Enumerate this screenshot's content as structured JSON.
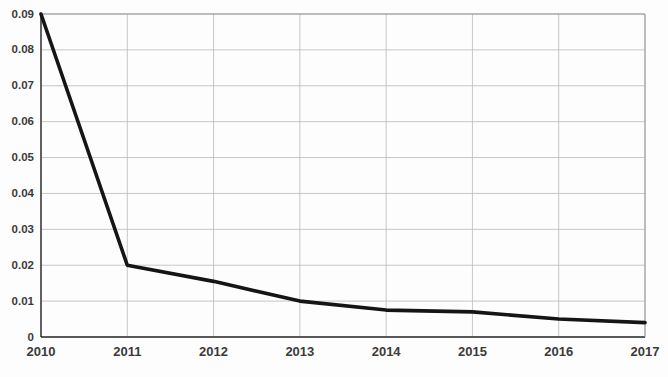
{
  "chart_data": {
    "type": "line",
    "title": "",
    "subtitle": "",
    "xlabel": "",
    "ylabel": "",
    "categories": [
      "2010",
      "2011",
      "2012",
      "2013",
      "2014",
      "2015",
      "2016",
      "2017"
    ],
    "x": [
      2010,
      2011,
      2012,
      2013,
      2014,
      2015,
      2016,
      2017
    ],
    "values": [
      0.09,
      0.02,
      0.0155,
      0.01,
      0.0075,
      0.007,
      0.005,
      0.004
    ],
    "series": [
      {
        "name": "series-1",
        "values": [
          0.09,
          0.02,
          0.0155,
          0.01,
          0.0075,
          0.007,
          0.005,
          0.004
        ]
      }
    ],
    "ylim": [
      0,
      0.09
    ],
    "xlim": [
      2010,
      2017
    ],
    "ytick_labels": [
      "0",
      "0.01",
      "0.02",
      "0.03",
      "0.04",
      "0.05",
      "0.06",
      "0.07",
      "0.08",
      "0.09"
    ],
    "ytick_values": [
      0,
      0.01,
      0.02,
      0.03,
      0.04,
      0.05,
      0.06,
      0.07,
      0.08,
      0.09
    ],
    "xtick_labels": [
      "2010",
      "2011",
      "2012",
      "2013",
      "2014",
      "2015",
      "2016",
      "2017"
    ],
    "grid": "both",
    "legend": "none",
    "line_color": "#151515",
    "grid_color": "#b9b9b9",
    "axis_color": "#2b2b2b",
    "background_color": "#fdfdfd",
    "annotations": []
  },
  "axes": {
    "y": {
      "ticks": [
        {
          "label": "0.09",
          "value": 0.09
        },
        {
          "label": "0.08",
          "value": 0.08
        },
        {
          "label": "0.07",
          "value": 0.07
        },
        {
          "label": "0.06",
          "value": 0.06
        },
        {
          "label": "0.05",
          "value": 0.05
        },
        {
          "label": "0.04",
          "value": 0.04
        },
        {
          "label": "0.03",
          "value": 0.03
        },
        {
          "label": "0.02",
          "value": 0.02
        },
        {
          "label": "0.01",
          "value": 0.01
        },
        {
          "label": "0",
          "value": 0
        }
      ]
    },
    "x": {
      "ticks": [
        {
          "label": "2010",
          "value": 2010
        },
        {
          "label": "2011",
          "value": 2011
        },
        {
          "label": "2012",
          "value": 2012
        },
        {
          "label": "2013",
          "value": 2013
        },
        {
          "label": "2014",
          "value": 2014
        },
        {
          "label": "2015",
          "value": 2015
        },
        {
          "label": "2016",
          "value": 2016
        },
        {
          "label": "2017",
          "value": 2017
        }
      ]
    }
  }
}
